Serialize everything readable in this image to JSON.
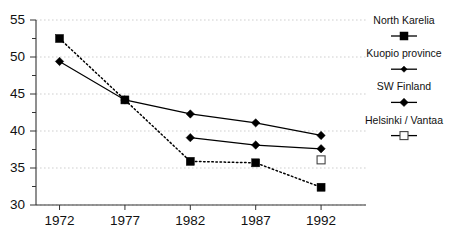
{
  "chart_data": {
    "type": "line",
    "title": "",
    "subtitle": "",
    "xlabel": "",
    "ylabel": "",
    "x": [
      1972,
      1977,
      1982,
      1987,
      1992
    ],
    "xtick_labels": [
      "1972",
      "1977",
      "1982",
      "1987",
      "1992"
    ],
    "ytick_labels": [
      "55",
      "50",
      "45",
      "40",
      "35",
      "30"
    ],
    "yticks": [
      55,
      50,
      45,
      40,
      35,
      30
    ],
    "xlim": [
      1970.2,
      1993.6
    ],
    "ylim": [
      30,
      55
    ],
    "grid": "horizontal-major-dotted",
    "legend_position": "right-outside",
    "series": [
      {
        "name": "North Karelia",
        "marker": "filled-square",
        "line": "dotted",
        "x": [
          1972,
          1977,
          1982,
          1987,
          1992
        ],
        "values": [
          52.5,
          44.2,
          35.9,
          35.7,
          32.4
        ]
      },
      {
        "name": "Kuopio province",
        "marker": "filled-diamond",
        "line": "solid",
        "x": [
          1972,
          1977,
          1982,
          1987,
          1992
        ],
        "values": [
          49.4,
          44.2,
          42.3,
          41.1,
          39.4
        ]
      },
      {
        "name": "SW Finland",
        "marker": "filled-diamond",
        "line": "solid",
        "x": [
          1982,
          1987,
          1992
        ],
        "values": [
          39.1,
          38.1,
          37.6
        ]
      },
      {
        "name": "Helsinki / Vantaa",
        "marker": "open-square",
        "line": "none",
        "x": [
          1992
        ],
        "values": [
          36.1
        ]
      }
    ]
  },
  "legend": {
    "entries": [
      {
        "label": "North Karelia",
        "marker": "filled-square"
      },
      {
        "label": "Kuopio province",
        "marker": "filled-diamond-small"
      },
      {
        "label": "SW Finland",
        "marker": "filled-diamond"
      },
      {
        "label": "Helsinki / Vantaa",
        "marker": "open-square"
      }
    ]
  },
  "colors": {
    "ink": "#000000",
    "axis": "#333333",
    "grid": "#c9c9c9",
    "background": "#ffffff"
  }
}
